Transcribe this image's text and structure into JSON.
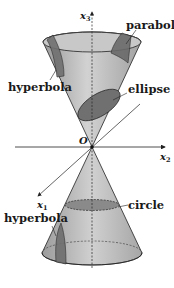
{
  "figure": {
    "labels": {
      "x3": "x",
      "x3_sub": "3",
      "x2": "x",
      "x2_sub": "2",
      "x1": "x",
      "x1_sub": "1",
      "origin": "O",
      "parabola": "parabola",
      "hyperbola_top": "hyperbola",
      "ellipse": "ellipse",
      "circle": "circle",
      "hyperbola_bottom": "hyperbola"
    },
    "colors": {
      "cone_fill": "#c4c4c4",
      "cone_dark": "#8a8a8a",
      "section_fill": "#6e6e6e",
      "line": "#222222"
    }
  }
}
